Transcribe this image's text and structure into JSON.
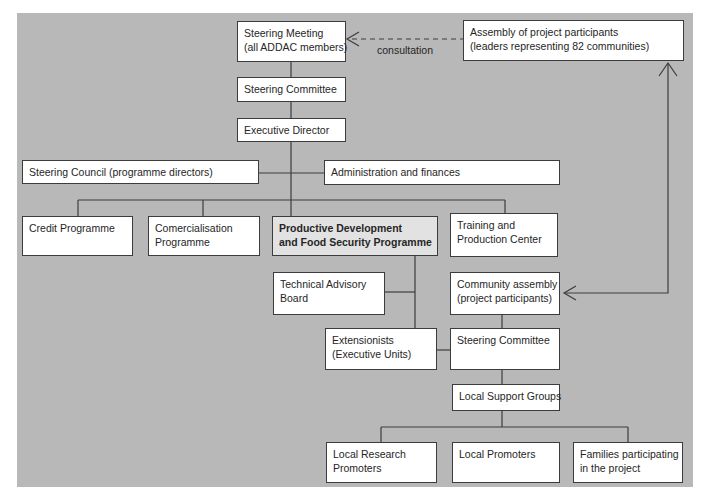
{
  "diagram": {
    "consultation_label": "consultation",
    "nodes": {
      "steering_meeting": {
        "line1": "Steering Meeting",
        "line2": "(all ADDAC members)"
      },
      "assembly": {
        "line1": "Assembly of project participants",
        "line2": "(leaders representing 82 communities)"
      },
      "steering_committee_top": {
        "line1": "Steering Committee"
      },
      "executive_director": {
        "line1": "Executive Director"
      },
      "steering_council": {
        "line1": "Steering Council (programme directors)"
      },
      "administration": {
        "line1": "Administration and finances"
      },
      "credit_programme": {
        "line1": "Credit Programme"
      },
      "comercialisation": {
        "line1": "Comercialisation",
        "line2": "Programme"
      },
      "productive_development": {
        "line1": "Productive Development",
        "line2": "and Food Security Programme"
      },
      "training_center": {
        "line1": "Training and",
        "line2": "Production Center"
      },
      "technical_advisory": {
        "line1": "Technical Advisory",
        "line2": "Board"
      },
      "community_assembly": {
        "line1": "Community assembly",
        "line2": "(project participants)"
      },
      "extensionists": {
        "line1": "Extensionists",
        "line2": "(Executive Units)"
      },
      "steering_committee_local": {
        "line1": "Steering Committee"
      },
      "local_support_groups": {
        "line1": "Local Support Groups"
      },
      "local_research_promoters": {
        "line1": "Local Research",
        "line2": "Promoters"
      },
      "local_promoters": {
        "line1": "Local Promoters"
      },
      "families": {
        "line1": "Families participating",
        "line2": "in the project"
      }
    },
    "colors": {
      "background": "#b8b8b8",
      "box_fill": "#ffffff",
      "box_border": "#3c3c3c",
      "highlight_fill": "#e2e2e2",
      "text": "#262626",
      "line": "#3c3c3c"
    }
  }
}
